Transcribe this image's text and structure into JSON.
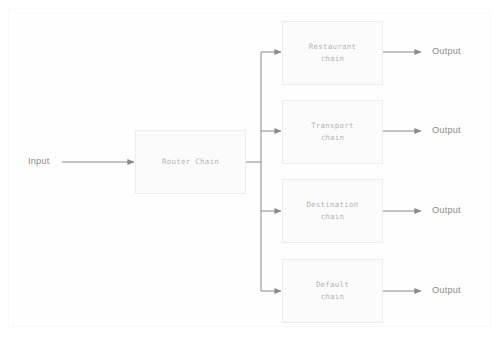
{
  "diagram": {
    "type": "flowchart",
    "colors": {
      "background": "#ffffff",
      "frame_border": "#fafafa",
      "box_border": "#ededed",
      "box_fill": "#fbfbfb",
      "box_label_text": "#b4b4b4",
      "io_label_text": "#8c8c8c",
      "connector_line": "#8a8a8a"
    },
    "input": {
      "label": "Input"
    },
    "router": {
      "label": "Router Chain"
    },
    "branches": [
      {
        "label": "Restaurant\nchain",
        "line1": "Restaurant",
        "line2": "chain",
        "output_label": "Output"
      },
      {
        "label": "Transport\nchain",
        "line1": "Transport",
        "line2": "chain",
        "output_label": "Output"
      },
      {
        "label": "Destination\nchain",
        "line1": "Destination",
        "line2": "chain",
        "output_label": "Output"
      },
      {
        "label": "Default\nchain",
        "line1": "Default",
        "line2": "chain",
        "output_label": "Output"
      }
    ]
  }
}
